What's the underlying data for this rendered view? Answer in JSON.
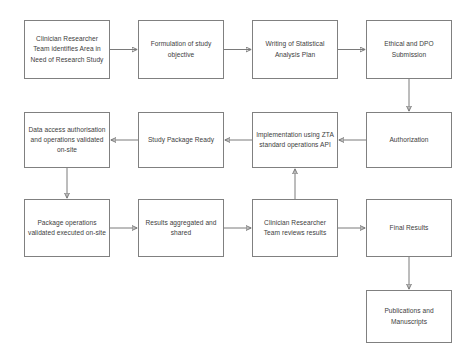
{
  "diagram": {
    "style": {
      "border_color": "#808080",
      "arrow_color": "#7a7a7a",
      "text_color": "#3d3d3d",
      "background": "#ffffff"
    },
    "nodes": [
      {
        "id": "identify-area",
        "label": "Clinician Researcher Team identifies Area in Need of Research Study",
        "x": 24,
        "y": 20,
        "w": 86,
        "h": 59
      },
      {
        "id": "formulation",
        "label": "Formulation of study objective",
        "x": 138,
        "y": 20,
        "w": 86,
        "h": 59
      },
      {
        "id": "statistical-analysis-plan",
        "label": "Writing of Statistical Analysis Plan",
        "x": 252,
        "y": 20,
        "w": 86,
        "h": 59
      },
      {
        "id": "ethical-dpo-submission",
        "label": "Ethical and DPO Submission",
        "x": 366,
        "y": 20,
        "w": 86,
        "h": 59
      },
      {
        "id": "data-access-authorisation",
        "label": "Data access authorisation and operations validated on-site",
        "x": 24,
        "y": 112,
        "w": 86,
        "h": 56
      },
      {
        "id": "study-package-ready",
        "label": "Study Package Ready",
        "x": 138,
        "y": 112,
        "w": 86,
        "h": 56
      },
      {
        "id": "implementation-zta",
        "label": "Implementation using ZTA standard operations API",
        "x": 252,
        "y": 112,
        "w": 86,
        "h": 56
      },
      {
        "id": "authorization",
        "label": "Authorization",
        "x": 366,
        "y": 112,
        "w": 86,
        "h": 56
      },
      {
        "id": "package-operations-validated",
        "label": "Package operations validated executed on-site",
        "x": 24,
        "y": 199,
        "w": 86,
        "h": 58
      },
      {
        "id": "results-aggregated",
        "label": "Results aggregated and shared",
        "x": 138,
        "y": 199,
        "w": 86,
        "h": 58
      },
      {
        "id": "team-reviews-results",
        "label": "Clinician Researcher Team reviews results",
        "x": 252,
        "y": 199,
        "w": 86,
        "h": 58
      },
      {
        "id": "final-results",
        "label": "Final Results",
        "x": 366,
        "y": 199,
        "w": 86,
        "h": 58
      },
      {
        "id": "publications-manuscripts",
        "label": "Publications and Manuscripts",
        "x": 366,
        "y": 290,
        "w": 86,
        "h": 53
      }
    ],
    "edges": [
      {
        "id": "identify-to-formulation",
        "from": "identify-area",
        "to": "formulation",
        "direction": "right"
      },
      {
        "id": "formulation-to-sap",
        "from": "formulation",
        "to": "statistical-analysis-plan",
        "direction": "right"
      },
      {
        "id": "sap-to-ethical",
        "from": "statistical-analysis-plan",
        "to": "ethical-dpo-submission",
        "direction": "right"
      },
      {
        "id": "ethical-to-authorization",
        "from": "ethical-dpo-submission",
        "to": "authorization",
        "direction": "down"
      },
      {
        "id": "authorization-to-implementation",
        "from": "authorization",
        "to": "implementation-zta",
        "direction": "left"
      },
      {
        "id": "implementation-to-study-package",
        "from": "implementation-zta",
        "to": "study-package-ready",
        "direction": "left"
      },
      {
        "id": "study-package-to-data-access",
        "from": "study-package-ready",
        "to": "data-access-authorisation",
        "direction": "left"
      },
      {
        "id": "data-access-to-package-operations",
        "from": "data-access-authorisation",
        "to": "package-operations-validated",
        "direction": "down"
      },
      {
        "id": "package-operations-to-results",
        "from": "package-operations-validated",
        "to": "results-aggregated",
        "direction": "right"
      },
      {
        "id": "results-to-team-reviews",
        "from": "results-aggregated",
        "to": "team-reviews-results",
        "direction": "right"
      },
      {
        "id": "team-reviews-to-implementation",
        "from": "team-reviews-results",
        "to": "implementation-zta",
        "direction": "up"
      },
      {
        "id": "team-reviews-to-final-results",
        "from": "team-reviews-results",
        "to": "final-results",
        "direction": "right"
      },
      {
        "id": "final-results-to-publications",
        "from": "final-results",
        "to": "publications-manuscripts",
        "direction": "down"
      }
    ]
  }
}
